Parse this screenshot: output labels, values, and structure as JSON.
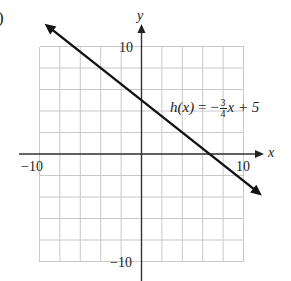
{
  "part_label": ")",
  "chart_data": {
    "type": "line",
    "title": "",
    "function_label": {
      "name": "h",
      "var": "x",
      "lhs": "h(x)",
      "equals": "=",
      "sign": "−",
      "numerator": "3",
      "denominator": "4",
      "tail": "x + 5",
      "full": "h(x) = -3/4 x + 5"
    },
    "slope": -0.75,
    "intercept": 5,
    "series": [
      {
        "name": "h(x) = -3/4 x + 5",
        "x": [
          -9.5,
          11.8
        ],
        "y": [
          12.125,
          -3.85
        ]
      }
    ],
    "xlabel": "x",
    "ylabel": "y",
    "xlim": [
      -10,
      10
    ],
    "ylim": [
      -10,
      10
    ],
    "x_tick_labels": [
      "−10",
      "10"
    ],
    "y_tick_labels": [
      "10",
      "−10"
    ],
    "grid": true,
    "grid_cells": 10,
    "grid_step": 2,
    "colors": {
      "line": "#111111",
      "grid": "#c8c8c8",
      "axis": "#333333"
    }
  }
}
